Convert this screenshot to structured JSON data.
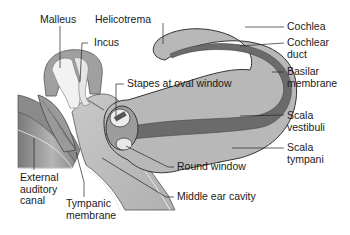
{
  "figure": {
    "colors": {
      "background": "#ffffff",
      "tissue_light": "#d9d9d9",
      "tissue_mid": "#a8a8a8",
      "tissue_dark": "#6e6e6e",
      "ossicle": "#f0f0f0",
      "outline": "#333333",
      "text": "#1a1a1a"
    }
  },
  "labels": {
    "malleus": "Malleus",
    "incus": "Incus",
    "helicotrema": "Helicotrema",
    "stapes": "Stapes at oval window",
    "cochlea": "Cochlea",
    "cochlear_duct": "Cochlear\nduct",
    "basilar_membrane": "Basilar\nmembrane",
    "scala_vestibuli": "Scala\nvestibuli",
    "scala_tympani": "Scala\ntympani",
    "round_window": "Round window",
    "middle_ear_cavity": "Middle ear cavity",
    "external_auditory_canal": "External\nauditory\ncanal",
    "tympanic_membrane": "Tympanic\nmembrane"
  }
}
